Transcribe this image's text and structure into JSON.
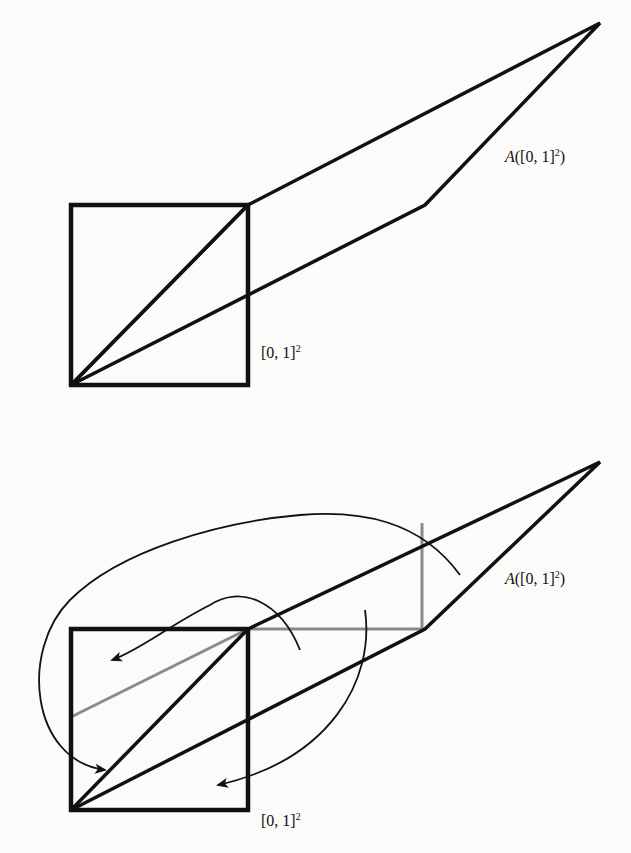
{
  "figures": [
    {
      "id": "top",
      "labels": {
        "image_prefix": "A",
        "image_text": "([0, 1]",
        "image_exp": "2",
        "image_close": ")",
        "square_text": "[0, 1]",
        "square_exp": "2"
      }
    },
    {
      "id": "bottom",
      "labels": {
        "image_prefix": "A",
        "image_text": "([0, 1]",
        "image_exp": "2",
        "image_close": ")",
        "square_text": "[0, 1]",
        "square_exp": "2"
      }
    }
  ],
  "colors": {
    "stroke": "#111111",
    "gray_stroke": "#8a8a8a",
    "background": "#fbfbf9"
  }
}
